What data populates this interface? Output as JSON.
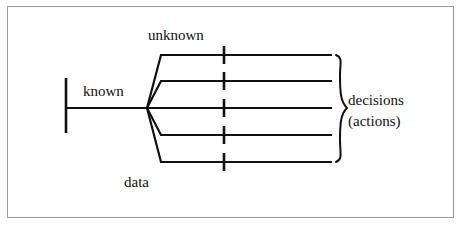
{
  "figure": {
    "type": "decision-tree-fan-diagram",
    "background_color": "#ffffff",
    "frame_color": "#9a9a9a",
    "stroke_color": "#111111",
    "labels": {
      "unknown": "unknown",
      "known": "known",
      "data": "data",
      "decisions": "decisions",
      "actions": "(actions)"
    },
    "geometry": {
      "trunk": {
        "bar_x": 66,
        "bar_top": 78,
        "bar_bottom": 133,
        "line_y": 108,
        "line_x_start": 66,
        "line_x_end": 147
      },
      "node": {
        "x": 147,
        "y": 108
      },
      "branch_bend_x": 161,
      "branch_end_x": 332,
      "branch_y": [
        55,
        81,
        108,
        135,
        162
      ],
      "tick_x": 224,
      "tick_half_height": 9,
      "brace": {
        "x": 336,
        "top": 55,
        "bottom": 162,
        "width": 11
      }
    },
    "branch_count": 5,
    "tick_count": 5
  }
}
